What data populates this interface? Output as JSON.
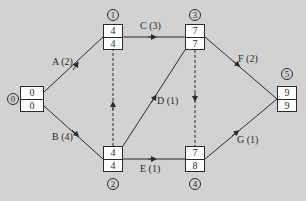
{
  "diagram": {
    "type": "activity-on-arrow network",
    "background_color": "#d2d2d2",
    "nodes": [
      {
        "id": "0",
        "earliest": "0",
        "latest": "0"
      },
      {
        "id": "1",
        "earliest": "4",
        "latest": "4"
      },
      {
        "id": "2",
        "earliest": "4",
        "latest": "4"
      },
      {
        "id": "3",
        "earliest": "7",
        "latest": "7"
      },
      {
        "id": "4",
        "earliest": "7",
        "latest": "8"
      },
      {
        "id": "5",
        "earliest": "9",
        "latest": "9"
      }
    ],
    "activities": [
      {
        "label": "A (2)",
        "from": "0",
        "to": "1",
        "dummy": false
      },
      {
        "label": "B (4)",
        "from": "0",
        "to": "2",
        "dummy": false
      },
      {
        "label": "C (3)",
        "from": "1",
        "to": "3",
        "dummy": false
      },
      {
        "label": "D (1)",
        "from": "2",
        "to": "3",
        "dummy": false
      },
      {
        "label": "E (1)",
        "from": "2",
        "to": "4",
        "dummy": false
      },
      {
        "label": "F (2)",
        "from": "3",
        "to": "5",
        "dummy": false
      },
      {
        "label": "G (1)",
        "from": "4",
        "to": "5",
        "dummy": false
      },
      {
        "label": "",
        "from": "2",
        "to": "1",
        "dummy": true
      },
      {
        "label": "",
        "from": "3",
        "to": "4",
        "dummy": true
      }
    ]
  }
}
